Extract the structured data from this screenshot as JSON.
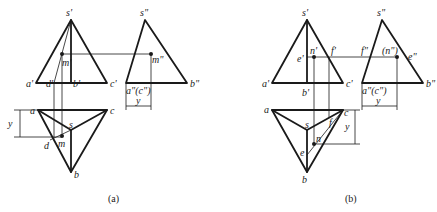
{
  "figure": {
    "panels": [
      {
        "caption": "(a)",
        "front_view": {
          "apex": "s'",
          "base_left": "a'",
          "base_mid_left": "d'",
          "base_mid": "b'",
          "base_right": "c'",
          "point": "m'"
        },
        "side_view": {
          "apex": "s\"",
          "base_left": "a\"(c\")",
          "base_right": "b\"",
          "point": "m\"",
          "dim": "y"
        },
        "top_view": {
          "a": "a",
          "c": "c",
          "s": "s",
          "b": "b",
          "d": "d",
          "point": "m",
          "dim": "y"
        }
      },
      {
        "caption": "(b)",
        "front_view": {
          "apex": "s'",
          "base_left": "a'",
          "base_mid": "b'",
          "base_right": "c'",
          "left_edge_pt": "e'",
          "point": "n'",
          "right_edge_pt": "f'"
        },
        "side_view": {
          "apex": "s\"",
          "base_left": "a\"(c\")",
          "base_right": "b\"",
          "left_edge_pt": "f\"",
          "point": "(n\")",
          "right_edge_pt": "e\"",
          "dim": "y"
        },
        "top_view": {
          "a": "a",
          "c": "c",
          "s": "s",
          "b": "b",
          "e": "e",
          "f": "f",
          "point": "n",
          "dim": "y"
        }
      }
    ]
  }
}
